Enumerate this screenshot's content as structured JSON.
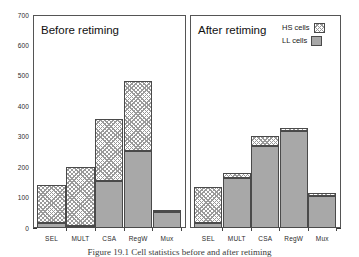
{
  "figure": {
    "caption": "Figure 19.1  Cell statistics before and after retiming"
  },
  "legend": {
    "position": "top-right",
    "entries": [
      {
        "label": "HS cells",
        "swatch": "hatched-swatch"
      },
      {
        "label": "LL cells",
        "swatch": "solid-gray-swatch"
      }
    ]
  },
  "axes": {
    "y_ticks": [
      "700",
      "600",
      "500",
      "400",
      "300",
      "200",
      "100",
      "0"
    ],
    "y_min": 0,
    "y_max": 700
  },
  "panels": [
    {
      "title": "Before retiming"
    },
    {
      "title": "After retiming"
    }
  ],
  "chart_data": {
    "type": "bar",
    "title": "Figure 19.1  Cell statistics before and after retiming",
    "subtype": "stacked-bar, two panels sharing y-axis",
    "xlabel": "",
    "ylabel": "",
    "ylim": [
      0,
      700
    ],
    "ytick_values": [
      0,
      100,
      200,
      300,
      400,
      500,
      600,
      700
    ],
    "grid": false,
    "legend_position": "top-right",
    "categories": [
      "SEL",
      "MULT",
      "CSA",
      "RegW",
      "Mux"
    ],
    "panels": [
      {
        "name": "Before retiming",
        "categories": [
          "SEL",
          "MULT",
          "CSA",
          "RegW",
          "Mux"
        ],
        "series": [
          {
            "name": "LL cells",
            "values": [
              18,
              5,
              153,
              252,
              52
            ]
          },
          {
            "name": "HS cells",
            "values": [
              122,
              195,
              205,
              231,
              8
            ]
          }
        ],
        "totals": [
          140,
          200,
          358,
          483,
          60
        ]
      },
      {
        "name": "After retiming",
        "categories": [
          "SEL",
          "MULT",
          "CSA",
          "RegW",
          "Mux"
        ],
        "series": [
          {
            "name": "LL cells",
            "values": [
              18,
              165,
              270,
              318,
              105
            ]
          },
          {
            "name": "HS cells",
            "values": [
              117,
              15,
              33,
              12,
              10
            ]
          }
        ],
        "totals": [
          135,
          180,
          303,
          330,
          115
        ]
      }
    ]
  },
  "colors": {
    "ll_fill": "#a8a8a8",
    "hs_hatch": "#9a9a9a",
    "outline": "#4a4a4a",
    "frame": "#555555",
    "text": "#1a1a1a"
  }
}
